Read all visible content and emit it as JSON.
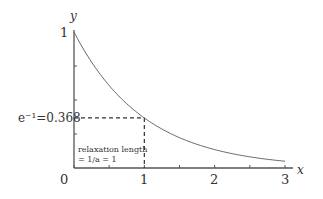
{
  "chart_data": {
    "type": "line",
    "title": "",
    "function": "y = exp(-a x), a = 1",
    "xlabel": "x",
    "ylabel": "y",
    "xlim": [
      0,
      3
    ],
    "ylim": [
      0,
      1
    ],
    "x_ticks": [
      0,
      1,
      2,
      3
    ],
    "x_minor_ticks": [
      0.5,
      1.5,
      2.5
    ],
    "y_minor_ticks": [
      0.25,
      0.5,
      0.75
    ],
    "y_tick_labels": [
      "1"
    ],
    "origin_label": "0",
    "x_tick_labels": [
      "1",
      "2",
      "3"
    ],
    "series": [
      {
        "name": "exp(-x)",
        "x": [
          0,
          0.25,
          0.5,
          0.75,
          1,
          1.25,
          1.5,
          1.75,
          2,
          2.25,
          2.5,
          2.75,
          3
        ],
        "values": [
          1,
          0.779,
          0.607,
          0.472,
          0.368,
          0.287,
          0.223,
          0.174,
          0.135,
          0.105,
          0.082,
          0.064,
          0.05
        ]
      }
    ],
    "marker_point": {
      "x": 1,
      "y": 0.368
    },
    "annotations": {
      "y_marker_label": "e⁻¹=0.368",
      "relaxation_line1": "relaxation length",
      "relaxation_line2": "= 1/a = 1"
    },
    "grid": false,
    "legend": "none"
  }
}
